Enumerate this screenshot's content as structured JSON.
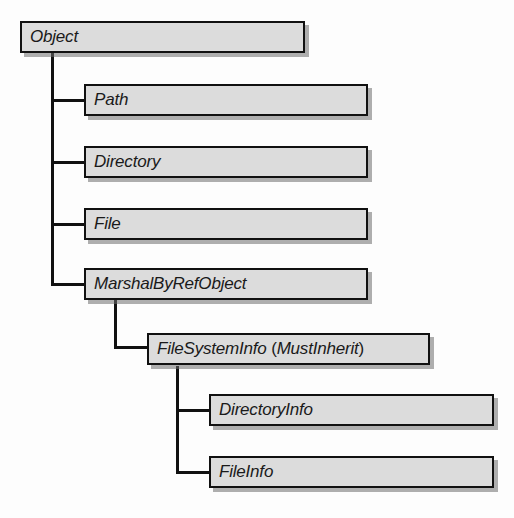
{
  "diagram": {
    "type": "class-hierarchy",
    "nodes": {
      "object": {
        "label": "Object"
      },
      "path": {
        "label": "Path"
      },
      "directory": {
        "label": "Directory"
      },
      "file": {
        "label": "File"
      },
      "marshal": {
        "label": "MarshalByRefObject"
      },
      "filesysteminfo": {
        "label": "FileSystemInfo",
        "paren_open": " (",
        "modifier": "MustInherit",
        "paren_close": ")"
      },
      "directoryinfo": {
        "label": "DirectoryInfo"
      },
      "fileinfo": {
        "label": "FileInfo"
      }
    },
    "edges": [
      {
        "from": "Object",
        "to": "Path"
      },
      {
        "from": "Object",
        "to": "Directory"
      },
      {
        "from": "Object",
        "to": "File"
      },
      {
        "from": "Object",
        "to": "MarshalByRefObject"
      },
      {
        "from": "MarshalByRefObject",
        "to": "FileSystemInfo"
      },
      {
        "from": "FileSystemInfo",
        "to": "DirectoryInfo"
      },
      {
        "from": "FileSystemInfo",
        "to": "FileInfo"
      }
    ],
    "colors": {
      "box_fill": "#dcdcdc",
      "box_border": "#111111",
      "shadow": "#6e6e6e",
      "background": "#fdfdfd"
    }
  }
}
